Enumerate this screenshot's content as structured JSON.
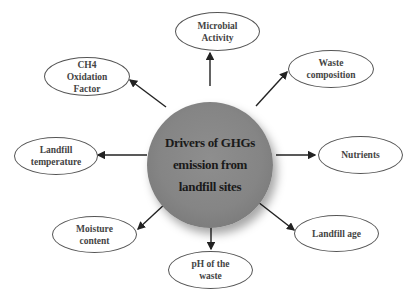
{
  "diagram": {
    "type": "hub-and-spoke",
    "center": {
      "label": "Drivers of GHGs\nemission from\nlandfill sites",
      "fill_color": "#858585"
    },
    "arrow_color": "#222222",
    "node_border_color": "#555555",
    "nodes": [
      {
        "id": "microbial-activity",
        "label": "Microbial\nActivity"
      },
      {
        "id": "waste-composition",
        "label": "Waste\ncomposition"
      },
      {
        "id": "nutrients",
        "label": "Nutrients"
      },
      {
        "id": "landfill-age",
        "label": "Landfill  age"
      },
      {
        "id": "ph-of-the-waste",
        "label": "pH  of the\nwaste"
      },
      {
        "id": "moisture-content",
        "label": "Moisture\ncontent"
      },
      {
        "id": "landfill-temperature",
        "label": "Landfill\ntemperature"
      },
      {
        "id": "ch4-oxidation-factor",
        "label": "CH4\nOxidation\nFactor"
      }
    ],
    "edges_direction": "center-to-node"
  }
}
